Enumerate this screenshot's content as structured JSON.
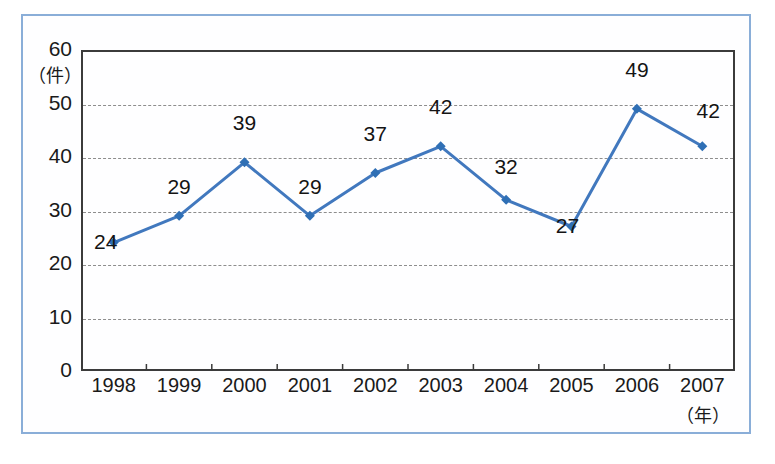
{
  "chart_data": {
    "type": "line",
    "title": "",
    "xlabel": "（年）",
    "ylabel": "（件）",
    "categories": [
      "1998",
      "1999",
      "2000",
      "2001",
      "2002",
      "2003",
      "2004",
      "2005",
      "2006",
      "2007"
    ],
    "values": [
      24,
      29,
      39,
      29,
      37,
      42,
      32,
      27,
      49,
      42
    ],
    "point_labels": [
      "24",
      "29",
      "39",
      "29",
      "37",
      "42",
      "32",
      "27",
      "49",
      "42"
    ],
    "ylim": [
      0,
      60
    ],
    "yticks": [
      "0",
      "10",
      "20",
      "30",
      "40",
      "50",
      "60"
    ],
    "ytick_values": [
      0,
      10,
      20,
      30,
      40,
      50,
      60
    ],
    "gridlines_at": [
      10,
      20,
      30,
      40,
      50
    ],
    "grid": true,
    "grid_style": "dashed",
    "legend": "none",
    "series_name": "件数",
    "series_color": "#4178be",
    "marker": "diamond",
    "marker_color": "#2f6fb5"
  },
  "colors": {
    "line": "#4178be",
    "marker": "#2f6fb5",
    "grid": "#8d8d8d",
    "axis": "#3b3b3b",
    "frame": "#8aaed8",
    "text": "#1a1a1a",
    "background": "#ffffff"
  },
  "caption": {
    "text": ""
  }
}
